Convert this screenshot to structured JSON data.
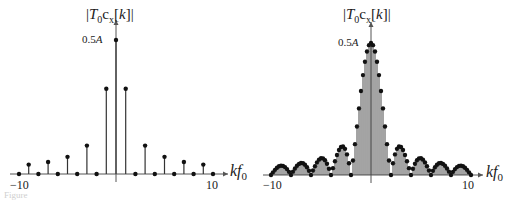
{
  "chart_data": [
    {
      "type": "stem",
      "title": "",
      "ylabel": "|T0 cx[k]|",
      "xlabel": "kf0",
      "peak_label": "0.5A",
      "xlim": [
        -10,
        10
      ],
      "ylim": [
        0,
        0.5
      ],
      "x_ticks": [
        "-10",
        "10"
      ],
      "sample_spacing": 1,
      "x": [
        -10,
        -9,
        -8,
        -7,
        -6,
        -5,
        -4,
        -3,
        -2,
        -1,
        0,
        1,
        2,
        3,
        4,
        5,
        6,
        7,
        8,
        9,
        10
      ],
      "values": [
        0,
        0.035,
        0,
        0.045,
        0,
        0.064,
        0,
        0.106,
        0,
        0.318,
        0.5,
        0.318,
        0,
        0.106,
        0,
        0.064,
        0,
        0.045,
        0,
        0.035,
        0
      ],
      "envelope": "0.5A * |sinc(kf0/2)|"
    },
    {
      "type": "stem",
      "title": "",
      "ylabel": "|T0 cx[k]|",
      "xlabel": "kf0",
      "peak_label": "0.5A",
      "xlim": [
        -10,
        10
      ],
      "ylim": [
        0,
        0.5
      ],
      "x_ticks": [
        "-10",
        "10"
      ],
      "sample_spacing": 0.2,
      "envelope": "0.5A * |sinc(kf0/2)|",
      "zeros_at": [
        -10,
        -8,
        -6,
        -4,
        -2,
        2,
        4,
        6,
        8,
        10
      ],
      "sidelobe_peaks": [
        {
          "x": 3,
          "value": 0.106
        },
        {
          "x": 5,
          "value": 0.064
        },
        {
          "x": 7,
          "value": 0.045
        },
        {
          "x": 9,
          "value": 0.035
        }
      ]
    }
  ],
  "labels": {
    "ylabel_T": "T",
    "ylabel_0": "0",
    "ylabel_c": "c",
    "ylabel_x": "x",
    "ylabel_k": "k",
    "peak_num": "0.5",
    "peak_A": "A",
    "tick_neg": "−10",
    "tick_pos": "10",
    "xlabel_k": "kf",
    "xlabel_0": "0",
    "caption": "Figure"
  },
  "colors": {
    "stem": "#333333",
    "axis": "#555555"
  }
}
